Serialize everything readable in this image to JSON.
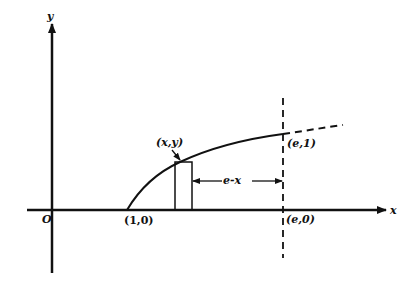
{
  "diagram": {
    "axes": {
      "x_label": "x",
      "y_label": "y",
      "origin_label": "O"
    },
    "points": {
      "start": "(1,0)",
      "sample": "(x,y)",
      "top": "(e,1)",
      "bottom": "(e,0)"
    },
    "annotations": {
      "distance": "e-x"
    },
    "curve": "y = ln x (solid from (1,0) to (e,1), dashed beyond)",
    "colors": {
      "ink": "#111111",
      "background": "#ffffff"
    }
  }
}
